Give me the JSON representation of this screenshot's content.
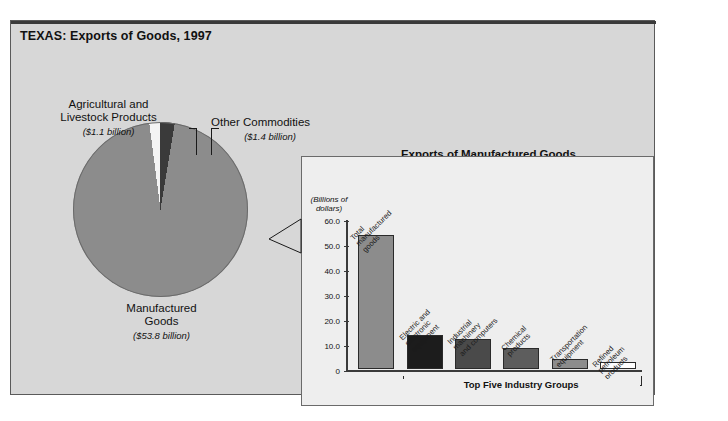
{
  "header": {
    "title": "TEXAS: Exports of Goods, 1997"
  },
  "chart_data": [
    {
      "type": "pie",
      "title": "TEXAS: Exports of Goods, 1997",
      "unit": "billions of dollars",
      "labels": [
        "Manufactured Goods",
        "Agricultural and Livestock Products",
        "Other Commodities"
      ],
      "values": [
        53.8,
        1.1,
        1.4
      ],
      "value_labels": [
        "($53.8 billion)",
        "($1.1 billion)",
        "($1.4 billion)"
      ],
      "colors": [
        "#8c8c8c",
        "#f4f4f4",
        "#3a3a3a"
      ],
      "legend": "none"
    },
    {
      "type": "bar",
      "title": "Exports of Manufactured Goods",
      "ylabel": "(Billions of dollars)",
      "xlabel": "",
      "ylim": [
        0,
        60
      ],
      "yticks": [
        "0",
        "10.0",
        "20.0",
        "30.0",
        "40.0",
        "50.0",
        "60.0"
      ],
      "grid": false,
      "categories": [
        "Total\nmanufactured\ngoods",
        "Electric and\nelectronic\nequipment",
        "Industrial\nmachinery\nand computers",
        "Chemical\nproducts",
        "Transportation\nequipment",
        "Refined\npetroleum\nproducts"
      ],
      "values": [
        53.8,
        13.6,
        12.0,
        8.5,
        4.2,
        2.8
      ],
      "colors": [
        "#8c8c8c",
        "#1c1c1c",
        "#4a4a4a",
        "#5d5d5d",
        "#8c8c8c",
        "#ffffff"
      ],
      "annotation": "Top Five Industry Groups",
      "annotation_span": [
        1,
        5
      ]
    }
  ],
  "bar_panel": {
    "title": "Exports of Manufactured Goods",
    "y_unit_line1": "(Billions of",
    "y_unit_line2": "dollars)",
    "bracket_label": "Top Five Industry Groups"
  },
  "pie_panel": {
    "label_agricultural": "Agricultural and\nLivestock Products",
    "amount_agricultural": "($1.1 billion)",
    "label_other": "Other Commodities",
    "amount_other": "($1.4 billion)",
    "label_manufactured": "Manufactured\nGoods",
    "amount_manufactured": "($53.8 billion)"
  }
}
